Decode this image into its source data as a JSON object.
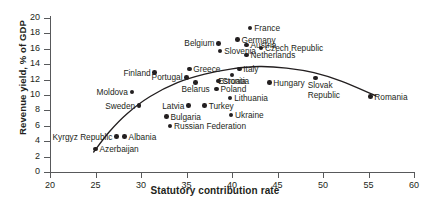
{
  "chart_data": {
    "type": "scatter",
    "title": "",
    "xlabel": "Statutory contribution rate",
    "ylabel": "Revenue yield, % of GDP",
    "xlim": [
      20,
      60
    ],
    "ylim": [
      0,
      20
    ],
    "xticks": [
      20,
      25,
      30,
      35,
      40,
      45,
      50,
      55,
      60
    ],
    "yticks": [
      0,
      2,
      4,
      6,
      8,
      10,
      12,
      14,
      16,
      18,
      20
    ],
    "grid": false,
    "legend": "none",
    "marker_color": "#231f20",
    "trendline": {
      "present": true,
      "style": "solid",
      "color": "#231f20",
      "description": "concave fitted curve rising from low rates, peaking near 43, declining to 56"
    },
    "points": [
      {
        "label": "Azerbaijan",
        "x": 25.0,
        "y": 3.0,
        "pos": "right"
      },
      {
        "label": "Kyrgyz Republic",
        "x": 27.3,
        "y": 4.6,
        "pos": "left"
      },
      {
        "label": "Albania",
        "x": 28.2,
        "y": 4.6,
        "pos": "right"
      },
      {
        "label": "Sweden",
        "x": 29.8,
        "y": 8.6,
        "pos": "left"
      },
      {
        "label": "Moldova",
        "x": 29.0,
        "y": 10.4,
        "pos": "left"
      },
      {
        "label": "Finland",
        "x": 31.5,
        "y": 12.9,
        "pos": "left"
      },
      {
        "label": "Bulgaria",
        "x": 32.8,
        "y": 7.2,
        "pos": "right"
      },
      {
        "label": "Russian Federation",
        "x": 33.2,
        "y": 6.0,
        "pos": "right"
      },
      {
        "label": "Latvia",
        "x": 35.2,
        "y": 8.6,
        "pos": "left"
      },
      {
        "label": "Turkey",
        "x": 37.0,
        "y": 8.6,
        "pos": "right"
      },
      {
        "label": "Portugal",
        "x": 35.0,
        "y": 12.3,
        "pos": "left"
      },
      {
        "label": "Greece",
        "x": 35.3,
        "y": 13.4,
        "pos": "right"
      },
      {
        "label": "Belarus",
        "x": 36.0,
        "y": 11.6,
        "pos": "below"
      },
      {
        "label": "Croatia",
        "x": 38.5,
        "y": 11.8,
        "pos": "right"
      },
      {
        "label": "Poland",
        "x": 38.3,
        "y": 10.8,
        "pos": "right"
      },
      {
        "label": "Belgium",
        "x": 38.5,
        "y": 16.7,
        "pos": "left"
      },
      {
        "label": "Slovenia",
        "x": 38.7,
        "y": 15.7,
        "pos": "right"
      },
      {
        "label": "Estonia",
        "x": 40.0,
        "y": 12.6,
        "pos": "below"
      },
      {
        "label": "Lithuania",
        "x": 39.8,
        "y": 9.6,
        "pos": "right"
      },
      {
        "label": "Ukraine",
        "x": 39.9,
        "y": 7.4,
        "pos": "right"
      },
      {
        "label": "Germany",
        "x": 40.6,
        "y": 17.2,
        "pos": "right"
      },
      {
        "label": "Italy",
        "x": 40.8,
        "y": 13.4,
        "pos": "right"
      },
      {
        "label": "France",
        "x": 42.0,
        "y": 18.7,
        "pos": "right"
      },
      {
        "label": "Austria",
        "x": 41.6,
        "y": 16.5,
        "pos": "right"
      },
      {
        "label": "Netherlands",
        "x": 41.6,
        "y": 15.2,
        "pos": "right"
      },
      {
        "label": "Czech Republic",
        "x": 43.2,
        "y": 16.1,
        "pos": "right"
      },
      {
        "label": "Hungary",
        "x": 44.1,
        "y": 11.6,
        "pos": "right"
      },
      {
        "label": "Slovak Republic",
        "x": 49.2,
        "y": 12.2,
        "pos": "two"
      },
      {
        "label": "Romania",
        "x": 55.2,
        "y": 9.8,
        "pos": "right"
      }
    ]
  },
  "axis": {
    "x_title": "Statutory contribution rate",
    "y_title": "Revenue yield, % of GDP"
  }
}
